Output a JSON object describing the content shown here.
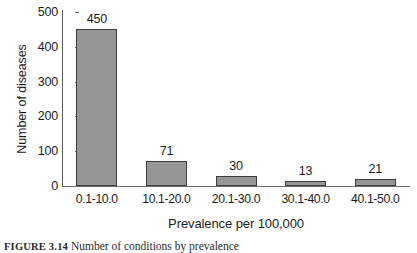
{
  "figure": {
    "caption_label": "FIGURE 3.14",
    "caption_text": "Number of conditions by prevalence"
  },
  "chart_data": {
    "type": "bar",
    "title": "",
    "subtitle": "",
    "categories": [
      "0.1-10.0",
      "10.1-20.0",
      "20.1-30.0",
      "30.1-40.0",
      "40.1-50.0"
    ],
    "values": [
      450,
      71,
      30,
      13,
      21
    ],
    "data_labels": [
      "450",
      "71",
      "30",
      "13",
      "21"
    ],
    "xlabel": "Prevalence per 100,000",
    "ylabel": "Number of diseases",
    "ylim": [
      0,
      500
    ],
    "yticks": [
      0,
      100,
      200,
      300,
      400,
      500
    ],
    "ytick_labels": [
      "0",
      "100",
      "200",
      "300",
      "400",
      "500"
    ],
    "grid": false,
    "legend": null,
    "bar_fill_color": "#969696",
    "bar_border_color": "#3c3c3c",
    "axis_color": "#6e6e6e",
    "background_color": "#ffffff"
  }
}
